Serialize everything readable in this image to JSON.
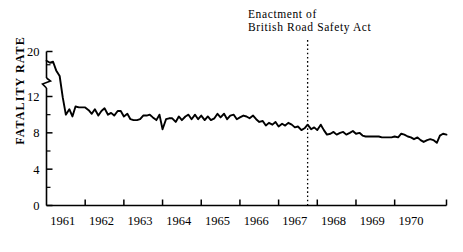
{
  "chart_data": {
    "type": "line",
    "title": "",
    "xlabel": "",
    "ylabel": "FATALITY RATE",
    "annotation_line1": "Enactment  of",
    "annotation_line2": "British  Road  Safety  Act",
    "annotation_x_year": 1967.33,
    "ylim": [
      0,
      20
    ],
    "axis_break": {
      "from": 12,
      "to": 20,
      "present": true
    },
    "ytick_labels": [
      "0",
      "4",
      "8",
      "12",
      "20"
    ],
    "ytick_values": [
      0,
      4,
      8,
      12,
      20
    ],
    "yminor_values": [
      2,
      6,
      10,
      14,
      18
    ],
    "xtick_labels": [
      "1961",
      "1962",
      "1963",
      "1964",
      "1965",
      "1966",
      "1967",
      "1968",
      "1969",
      "1970"
    ],
    "xtick_values": [
      1961,
      1962,
      1963,
      1964,
      1965,
      1966,
      1967,
      1968,
      1969,
      1970
    ],
    "xlim": [
      1960.58,
      1970.92
    ],
    "grid": false,
    "legend": "none",
    "line_color": "#000000",
    "series": [
      {
        "name": "Monthly fatality rate",
        "x": [
          1960.58,
          1960.67,
          1960.75,
          1960.83,
          1960.92,
          1961.0,
          1961.08,
          1961.17,
          1961.25,
          1961.33,
          1961.42,
          1961.5,
          1961.58,
          1961.67,
          1961.75,
          1961.83,
          1961.92,
          1962.0,
          1962.08,
          1962.17,
          1962.25,
          1962.33,
          1962.42,
          1962.5,
          1962.58,
          1962.67,
          1962.75,
          1962.83,
          1962.92,
          1963.0,
          1963.08,
          1963.17,
          1963.25,
          1963.33,
          1963.42,
          1963.5,
          1963.58,
          1963.67,
          1963.75,
          1963.83,
          1963.92,
          1964.0,
          1964.08,
          1964.17,
          1964.25,
          1964.33,
          1964.42,
          1964.5,
          1964.58,
          1964.67,
          1964.75,
          1964.83,
          1964.92,
          1965.0,
          1965.08,
          1965.17,
          1965.25,
          1965.33,
          1965.42,
          1965.5,
          1965.58,
          1965.67,
          1965.75,
          1965.83,
          1965.92,
          1966.0,
          1966.08,
          1966.17,
          1966.25,
          1966.33,
          1966.42,
          1966.5,
          1966.58,
          1966.67,
          1966.75,
          1966.83,
          1966.92,
          1967.0,
          1967.08,
          1967.17,
          1967.25,
          1967.33,
          1967.42,
          1967.5,
          1967.58,
          1967.67,
          1967.75,
          1967.83,
          1967.92,
          1968.0,
          1968.08,
          1968.17,
          1968.25,
          1968.33,
          1968.42,
          1968.5,
          1968.58,
          1968.67,
          1968.75,
          1968.83,
          1968.92,
          1969.0,
          1969.08,
          1969.17,
          1969.25,
          1969.33,
          1969.42,
          1969.5,
          1969.58,
          1969.67,
          1969.75,
          1969.83,
          1969.92,
          1970.0,
          1970.08,
          1970.17,
          1970.25,
          1970.33,
          1970.42,
          1970.5,
          1970.58,
          1970.67,
          1970.75,
          1970.83,
          1970.92
        ],
        "values": [
          17.2,
          16.6,
          16.9,
          14.3,
          12.6,
          11.9,
          10.0,
          10.6,
          9.8,
          10.9,
          10.8,
          10.8,
          10.8,
          10.5,
          10.1,
          10.6,
          9.9,
          10.4,
          10.7,
          10.0,
          10.2,
          9.9,
          10.4,
          10.4,
          9.8,
          10.1,
          9.5,
          9.4,
          9.4,
          9.5,
          9.9,
          9.9,
          10.0,
          9.7,
          9.4,
          10.0,
          8.4,
          9.5,
          9.6,
          9.6,
          9.2,
          9.8,
          9.4,
          9.8,
          10.0,
          9.5,
          10.0,
          9.5,
          9.9,
          9.4,
          9.8,
          9.4,
          9.6,
          10.1,
          9.7,
          10.1,
          9.5,
          9.9,
          10.0,
          9.5,
          9.7,
          9.9,
          9.8,
          9.6,
          9.9,
          9.5,
          9.2,
          9.3,
          8.8,
          9.1,
          8.9,
          9.2,
          8.7,
          9.0,
          8.8,
          9.1,
          8.9,
          8.6,
          8.7,
          8.3,
          8.5,
          8.9,
          8.4,
          8.6,
          8.3,
          8.9,
          8.3,
          7.8,
          7.9,
          8.1,
          7.8,
          8.0,
          8.1,
          7.8,
          8.0,
          8.2,
          7.9,
          8.0,
          7.7,
          7.6,
          7.6,
          7.6,
          7.6,
          7.6,
          7.5,
          7.5,
          7.5,
          7.5,
          7.6,
          7.5,
          7.9,
          7.8,
          7.6,
          7.5,
          7.3,
          7.5,
          7.2,
          7.0,
          7.2,
          7.3,
          7.2,
          6.9,
          7.7,
          7.9,
          7.8
        ]
      }
    ]
  }
}
